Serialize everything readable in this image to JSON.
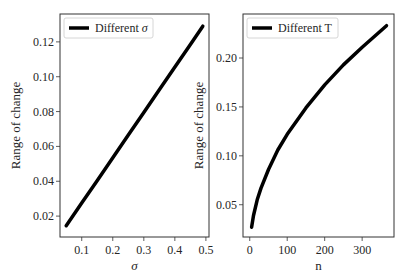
{
  "chart_data": [
    {
      "type": "line",
      "title": "",
      "xlabel": "σ",
      "ylabel": "Range of change",
      "xlim": [
        0.03,
        0.51
      ],
      "ylim": [
        0.008,
        0.136
      ],
      "xticks": [
        0.1,
        0.2,
        0.3,
        0.4,
        0.5
      ],
      "xtick_labels": [
        "0.1",
        "0.2",
        "0.3",
        "0.4",
        "0.5"
      ],
      "yticks": [
        0.02,
        0.04,
        0.06,
        0.08,
        0.1,
        0.12
      ],
      "ytick_labels": [
        "0.02",
        "0.04",
        "0.06",
        "0.08",
        "0.10",
        "0.12"
      ],
      "grid": false,
      "legend_position": "upper left",
      "series": [
        {
          "name": "Different σ",
          "color": "#000000",
          "x": [
            0.05,
            0.1,
            0.15,
            0.2,
            0.25,
            0.3,
            0.35,
            0.4,
            0.45,
            0.49
          ],
          "values": [
            0.0145,
            0.0275,
            0.0405,
            0.0535,
            0.0665,
            0.0795,
            0.0925,
            0.1055,
            0.1185,
            0.129
          ]
        }
      ]
    },
    {
      "type": "line",
      "title": "",
      "xlabel": "n",
      "ylabel": "Range of change",
      "xlim": [
        -18,
        385
      ],
      "ylim": [
        0.017,
        0.245
      ],
      "xticks": [
        0,
        100,
        200,
        300
      ],
      "xtick_labels": [
        "0",
        "100",
        "200",
        "300"
      ],
      "yticks": [
        0.05,
        0.1,
        0.15,
        0.2
      ],
      "ytick_labels": [
        "0.05",
        "0.10",
        "0.15",
        "0.20"
      ],
      "grid": false,
      "legend_position": "upper left",
      "series": [
        {
          "name": "Different T",
          "color": "#000000",
          "x": [
            5,
            10,
            20,
            30,
            50,
            75,
            100,
            150,
            200,
            250,
            300,
            365
          ],
          "values": [
            0.027,
            0.039,
            0.055,
            0.067,
            0.086,
            0.106,
            0.122,
            0.149,
            0.1725,
            0.193,
            0.211,
            0.233
          ]
        }
      ]
    }
  ]
}
